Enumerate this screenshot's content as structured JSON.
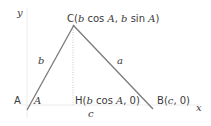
{
  "diagram": {
    "type": "triangle-coordinate-geometry",
    "colors": {
      "edge": "#7a7a7a",
      "axis": "#e6e6e6",
      "dotted": "#c8c8c8",
      "text": "#3a3a3a"
    },
    "axes": {
      "x_label": "x",
      "y_label": "y"
    },
    "points": {
      "A": {
        "name": "A",
        "label": "A"
      },
      "B": {
        "name": "B",
        "label": "B",
        "coords": "(c, 0)",
        "coord_parts": [
          "(",
          "c",
          ", 0)"
        ]
      },
      "C": {
        "name": "C",
        "label": "C",
        "coords": "(b cos A, b sin A)",
        "coord_parts": [
          "(",
          "b",
          " cos ",
          "A",
          ", ",
          "b",
          " sin ",
          "A",
          ")"
        ]
      },
      "H": {
        "name": "H",
        "label": "H",
        "coords": "(b cos A, 0)",
        "coord_parts": [
          "(",
          "b",
          " cos ",
          "A",
          ", 0)"
        ]
      }
    },
    "sides": {
      "a": "a",
      "b": "b",
      "c": "c"
    },
    "angle_label": "A"
  }
}
